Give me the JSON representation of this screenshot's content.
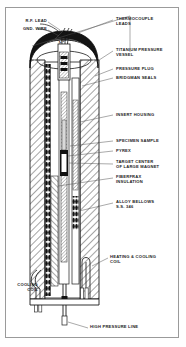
{
  "figure": {
    "border_color": "#9a9a9a",
    "ink_color": "#1a1a1a",
    "background": "#ffffff"
  },
  "dimensions": [
    {
      "name": "outer-diameter",
      "text": "4.00 O.D."
    }
  ],
  "labels_left": [
    {
      "name": "rf-lead",
      "text": "R.F. LEAD"
    },
    {
      "name": "gnd-wire",
      "text": "GND. WIRE"
    },
    {
      "name": "cooling-coil",
      "text": "COOLING\nCOIL"
    }
  ],
  "labels_right": [
    {
      "name": "thermocouple-leads",
      "text": "THERMOCOUPLE\nLEADS"
    },
    {
      "name": "titanium-pressure-vessel",
      "text": "TITANIUM PRESSURE\nVESSEL"
    },
    {
      "name": "pressure-plug",
      "text": "PRESSURE PLUG"
    },
    {
      "name": "bridgman-seals",
      "text": "BRIDGMAN SEALS"
    },
    {
      "name": "insert-housing",
      "text": "INSERT HOUSING"
    },
    {
      "name": "specimen-sample",
      "text": "SPECIMEN SAMPLE"
    },
    {
      "name": "pyrex",
      "text": "PYREX"
    },
    {
      "name": "target-center",
      "text": "TARGET CENTER\nOF LARGE MAGNET"
    },
    {
      "name": "fiberfrax-insulation",
      "text": "FIBERFRAX\nINSULATION"
    },
    {
      "name": "alloy-bellows",
      "text": "ALLOY BELLOWS\nS.S. 346"
    },
    {
      "name": "heating-cooling-coil",
      "text": "HEATING & COOLING\nCOIL"
    }
  ],
  "labels_bottom": [
    {
      "name": "high-pressure-line",
      "text": "HIGH PRESSURE LINE"
    }
  ]
}
